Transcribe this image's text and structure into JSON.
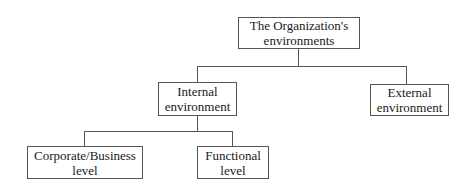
{
  "diagram": {
    "type": "tree",
    "nodes": [
      {
        "id": "root",
        "label": "The Organization's\nenvironments",
        "level": 0
      },
      {
        "id": "internal",
        "label": "Internal\nenvironment",
        "level": 1,
        "parent": "root"
      },
      {
        "id": "external",
        "label": "External\nenvironment",
        "level": 1,
        "parent": "root"
      },
      {
        "id": "corporate",
        "label": "Corporate/Business\nlevel",
        "level": 2,
        "parent": "internal"
      },
      {
        "id": "functional",
        "label": "Functional\nlevel",
        "level": 2,
        "parent": "internal"
      }
    ],
    "line_color": "#555555",
    "background": "#ffffff"
  }
}
